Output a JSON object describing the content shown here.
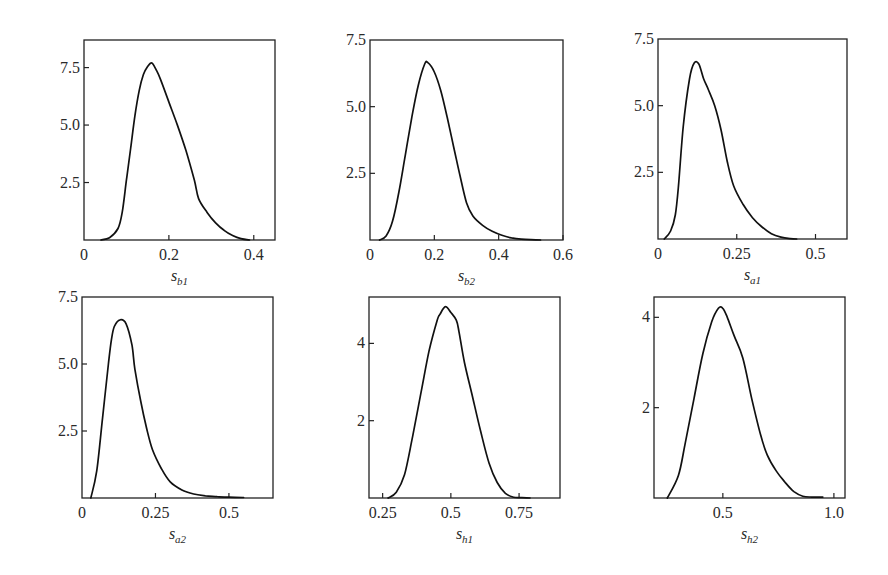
{
  "chart_data": [
    {
      "type": "line",
      "title": "",
      "xlabel": "s_b1",
      "xlabel_base": "s",
      "xlabel_sub": "b1",
      "ylabel": "",
      "xlim": [
        0,
        0.45
      ],
      "ylim": [
        0,
        8.7
      ],
      "xticks": [
        0,
        0.2,
        0.4
      ],
      "xtick_labels": [
        "0",
        "0.2",
        "0.4"
      ],
      "yticks": [
        2.5,
        5.0,
        7.5
      ],
      "ytick_labels": [
        "2.5",
        "5.0",
        "7.5"
      ],
      "grid": false,
      "box": {
        "x": 84,
        "y": 40,
        "w": 191,
        "h": 200
      },
      "series": [
        {
          "name": "density s_b1",
          "x": [
            0.04,
            0.06,
            0.08,
            0.09,
            0.1,
            0.11,
            0.12,
            0.13,
            0.14,
            0.15,
            0.16,
            0.17,
            0.18,
            0.2,
            0.22,
            0.24,
            0.26,
            0.27,
            0.29,
            0.31,
            0.33,
            0.35,
            0.37,
            0.39
          ],
          "y": [
            0.0,
            0.1,
            0.5,
            1.2,
            2.6,
            4.0,
            5.4,
            6.5,
            7.2,
            7.55,
            7.7,
            7.4,
            7.0,
            6.0,
            5.0,
            3.9,
            2.6,
            1.8,
            1.2,
            0.75,
            0.42,
            0.2,
            0.06,
            0.0
          ]
        }
      ]
    },
    {
      "type": "line",
      "title": "",
      "xlabel": "s_b2",
      "xlabel_base": "s",
      "xlabel_sub": "b2",
      "ylabel": "",
      "xlim": [
        0,
        0.6
      ],
      "ylim": [
        0,
        7.5
      ],
      "xticks": [
        0,
        0.2,
        0.4,
        0.6
      ],
      "xtick_labels": [
        "0",
        "0.2",
        "0.4",
        "0.6"
      ],
      "yticks": [
        2.5,
        5.0,
        7.5
      ],
      "ytick_labels": [
        "2.5",
        "5.0",
        "7.5"
      ],
      "grid": false,
      "box": {
        "x": 370,
        "y": 40,
        "w": 193,
        "h": 200
      },
      "series": [
        {
          "name": "density s_b2",
          "x": [
            0.03,
            0.05,
            0.07,
            0.09,
            0.11,
            0.13,
            0.15,
            0.17,
            0.18,
            0.2,
            0.22,
            0.24,
            0.26,
            0.28,
            0.3,
            0.32,
            0.35,
            0.38,
            0.41,
            0.44,
            0.47,
            0.5,
            0.53
          ],
          "y": [
            0.0,
            0.15,
            0.7,
            1.8,
            3.2,
            4.6,
            5.8,
            6.6,
            6.65,
            6.3,
            5.6,
            4.6,
            3.5,
            2.4,
            1.4,
            0.9,
            0.55,
            0.33,
            0.18,
            0.08,
            0.03,
            0.01,
            0.0
          ]
        }
      ]
    },
    {
      "type": "line",
      "title": "",
      "xlabel": "s_a1",
      "xlabel_base": "s",
      "xlabel_sub": "a1",
      "ylabel": "",
      "xlim": [
        0,
        0.6
      ],
      "ylim": [
        0,
        7.5
      ],
      "xticks": [
        0,
        0.25,
        0.5
      ],
      "xtick_labels": [
        "0",
        "0.25",
        "0.5"
      ],
      "yticks": [
        2.5,
        5.0,
        7.5
      ],
      "ytick_labels": [
        "2.5",
        "5.0",
        "7.5"
      ],
      "grid": false,
      "box": {
        "x": 658,
        "y": 39,
        "w": 189,
        "h": 200
      },
      "series": [
        {
          "name": "density s_a1",
          "x": [
            0.02,
            0.04,
            0.055,
            0.065,
            0.08,
            0.1,
            0.115,
            0.13,
            0.145,
            0.16,
            0.18,
            0.2,
            0.22,
            0.24,
            0.27,
            0.3,
            0.33,
            0.36,
            0.39,
            0.42,
            0.44
          ],
          "y": [
            0.0,
            0.3,
            0.9,
            2.0,
            4.2,
            6.0,
            6.6,
            6.55,
            6.0,
            5.6,
            5.0,
            4.1,
            2.9,
            2.0,
            1.3,
            0.8,
            0.45,
            0.2,
            0.07,
            0.01,
            0.0
          ]
        }
      ]
    },
    {
      "type": "line",
      "title": "",
      "xlabel": "s_a2",
      "xlabel_base": "s",
      "xlabel_sub": "a2",
      "ylabel": "",
      "xlim": [
        0,
        0.65
      ],
      "ylim": [
        0,
        7.5
      ],
      "xticks": [
        0,
        0.25,
        0.5
      ],
      "xtick_labels": [
        "0",
        "0.25",
        "0.5"
      ],
      "yticks": [
        2.5,
        5.0,
        7.5
      ],
      "ytick_labels": [
        "2.5",
        "5.0",
        "7.5"
      ],
      "grid": false,
      "box": {
        "x": 82,
        "y": 297,
        "w": 191,
        "h": 201
      },
      "series": [
        {
          "name": "density s_a2",
          "x": [
            0.03,
            0.05,
            0.07,
            0.09,
            0.1,
            0.11,
            0.13,
            0.15,
            0.17,
            0.18,
            0.2,
            0.22,
            0.24,
            0.27,
            0.3,
            0.34,
            0.38,
            0.42,
            0.46,
            0.5,
            0.55
          ],
          "y": [
            0.0,
            1.0,
            3.0,
            5.0,
            5.9,
            6.4,
            6.65,
            6.5,
            5.7,
            4.8,
            3.6,
            2.6,
            1.8,
            1.1,
            0.6,
            0.3,
            0.15,
            0.08,
            0.05,
            0.03,
            0.02
          ]
        }
      ]
    },
    {
      "type": "line",
      "title": "",
      "xlabel": "s_h1",
      "xlabel_base": "s",
      "xlabel_sub": "h1",
      "ylabel": "",
      "xlim": [
        0.2,
        0.9
      ],
      "ylim": [
        0,
        5.2
      ],
      "xticks": [
        0.25,
        0.5,
        0.75
      ],
      "xtick_labels": [
        "0.25",
        "0.5",
        "0.75"
      ],
      "yticks": [
        2,
        4
      ],
      "ytick_labels": [
        "2",
        "4"
      ],
      "grid": false,
      "box": {
        "x": 369,
        "y": 297,
        "w": 191,
        "h": 201
      },
      "series": [
        {
          "name": "density s_h1",
          "x": [
            0.27,
            0.3,
            0.33,
            0.36,
            0.39,
            0.42,
            0.45,
            0.46,
            0.48,
            0.5,
            0.52,
            0.53,
            0.55,
            0.58,
            0.61,
            0.64,
            0.67,
            0.7,
            0.73,
            0.76,
            0.79
          ],
          "y": [
            0.0,
            0.15,
            0.6,
            1.6,
            2.7,
            3.8,
            4.6,
            4.75,
            4.95,
            4.8,
            4.6,
            4.3,
            3.5,
            2.6,
            1.7,
            0.9,
            0.4,
            0.12,
            0.02,
            0.01,
            0.0
          ]
        }
      ]
    },
    {
      "type": "line",
      "title": "",
      "xlabel": "s_h2",
      "xlabel_base": "s",
      "xlabel_sub": "h2",
      "ylabel": "",
      "xlim": [
        0.19,
        1.05
      ],
      "ylim": [
        0,
        4.45
      ],
      "xticks": [
        0.5,
        1.0
      ],
      "xtick_labels": [
        "0.5",
        "1.0"
      ],
      "yticks": [
        2,
        4
      ],
      "ytick_labels": [
        "2",
        "4"
      ],
      "grid": false,
      "box": {
        "x": 654,
        "y": 297,
        "w": 191,
        "h": 201
      },
      "series": [
        {
          "name": "density s_h2",
          "x": [
            0.25,
            0.3,
            0.33,
            0.37,
            0.41,
            0.45,
            0.48,
            0.5,
            0.52,
            0.55,
            0.59,
            0.63,
            0.67,
            0.7,
            0.74,
            0.78,
            0.82,
            0.86,
            0.9,
            0.95
          ],
          "y": [
            0.0,
            0.5,
            1.2,
            2.2,
            3.2,
            3.9,
            4.2,
            4.2,
            4.0,
            3.6,
            3.1,
            2.2,
            1.4,
            0.95,
            0.6,
            0.35,
            0.14,
            0.04,
            0.02,
            0.02
          ]
        }
      ]
    }
  ]
}
